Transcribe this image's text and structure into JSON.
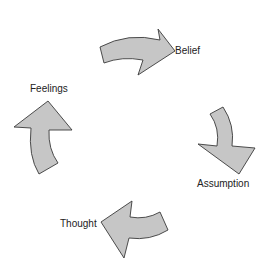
{
  "diagram": {
    "type": "cycle",
    "colors": {
      "arrow_fill": "#c6c6c6",
      "arrow_stroke": "#3a3a3a",
      "text": "#222222",
      "background": "#ffffff"
    },
    "nodes": [
      {
        "id": "belief",
        "label": "Belief"
      },
      {
        "id": "assumption",
        "label": "Assumption"
      },
      {
        "id": "thought",
        "label": "Thought"
      },
      {
        "id": "feelings",
        "label": "Feelings"
      }
    ],
    "edges": [
      {
        "from": "feelings",
        "to": "belief",
        "icon": "curved-arrow-right-icon"
      },
      {
        "from": "belief",
        "to": "assumption",
        "icon": "curved-arrow-down-icon"
      },
      {
        "from": "assumption",
        "to": "thought",
        "icon": "curved-arrow-left-icon"
      },
      {
        "from": "thought",
        "to": "feelings",
        "icon": "curved-arrow-up-icon"
      }
    ]
  }
}
